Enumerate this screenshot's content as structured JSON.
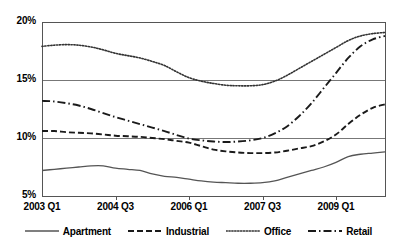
{
  "chart_data": {
    "type": "line",
    "title": "",
    "xlabel": "",
    "ylabel": "",
    "ylim": [
      5,
      20
    ],
    "ytick_values": [
      20,
      15,
      10,
      5
    ],
    "ytick_labels": [
      "20%",
      "15%",
      "10%",
      "5%"
    ],
    "grid": true,
    "grid_axis": "y",
    "legend_position": "bottom",
    "x_index_range": [
      0,
      28
    ],
    "xtick_indices": [
      0,
      6,
      12,
      18,
      24
    ],
    "categories": [
      "2003 Q1",
      "2003 Q2",
      "2003 Q3",
      "2003 Q4",
      "2004 Q1",
      "2004 Q2",
      "2004 Q3",
      "2004 Q4",
      "2005 Q1",
      "2005 Q2",
      "2005 Q3",
      "2005 Q4",
      "2006 Q1",
      "2006 Q2",
      "2006 Q3",
      "2006 Q4",
      "2007 Q1",
      "2007 Q2",
      "2007 Q3",
      "2007 Q4",
      "2008 Q1",
      "2008 Q2",
      "2008 Q3",
      "2008 Q4",
      "2009 Q1",
      "2009 Q2",
      "2009 Q3",
      "2009 Q4",
      "2010 Q1"
    ],
    "xtick_labels": [
      "2003 Q1",
      "2004 Q3",
      "2006 Q1",
      "2007 Q3",
      "2009 Q1"
    ],
    "series": [
      {
        "name": "Apartment",
        "style": "solid",
        "color": "#555555",
        "values": [
          7.2,
          7.3,
          7.4,
          7.5,
          7.6,
          7.6,
          7.4,
          7.3,
          7.2,
          6.9,
          6.7,
          6.6,
          6.45,
          6.3,
          6.2,
          6.15,
          6.1,
          6.1,
          6.15,
          6.3,
          6.6,
          6.9,
          7.2,
          7.5,
          7.9,
          8.4,
          8.6,
          8.7,
          8.8
        ]
      },
      {
        "name": "Industrial",
        "style": "dashed",
        "color": "#1a1a1a",
        "values": [
          10.6,
          10.6,
          10.5,
          10.45,
          10.4,
          10.3,
          10.2,
          10.15,
          10.1,
          10.0,
          9.9,
          9.75,
          9.6,
          9.3,
          9.0,
          8.85,
          8.75,
          8.7,
          8.7,
          8.75,
          8.9,
          9.1,
          9.3,
          9.7,
          10.3,
          11.2,
          12.0,
          12.6,
          12.9
        ]
      },
      {
        "name": "Office",
        "style": "dotted",
        "color": "#333333",
        "values": [
          17.9,
          18.0,
          18.05,
          18.0,
          17.85,
          17.6,
          17.3,
          17.1,
          16.9,
          16.6,
          16.25,
          15.7,
          15.2,
          14.9,
          14.7,
          14.55,
          14.5,
          14.5,
          14.6,
          14.9,
          15.4,
          16.0,
          16.6,
          17.2,
          17.8,
          18.4,
          18.8,
          19.0,
          19.1
        ]
      },
      {
        "name": "Retail",
        "style": "dashdot",
        "color": "#1a1a1a",
        "values": [
          13.2,
          13.15,
          13.0,
          12.8,
          12.5,
          12.15,
          11.8,
          11.5,
          11.2,
          10.9,
          10.6,
          10.25,
          9.95,
          9.8,
          9.7,
          9.65,
          9.7,
          9.8,
          10.0,
          10.4,
          11.0,
          11.9,
          13.0,
          14.3,
          15.6,
          16.9,
          17.9,
          18.5,
          18.8
        ]
      }
    ]
  },
  "legend": {
    "items": [
      {
        "label": "Apartment",
        "style": "solid"
      },
      {
        "label": "Industrial",
        "style": "dashed"
      },
      {
        "label": "Office",
        "style": "dotted"
      },
      {
        "label": "Retail",
        "style": "dashdot"
      }
    ]
  },
  "axis_colors": {
    "frame": "#555555",
    "gridline": "#777777",
    "text": "#000000"
  }
}
